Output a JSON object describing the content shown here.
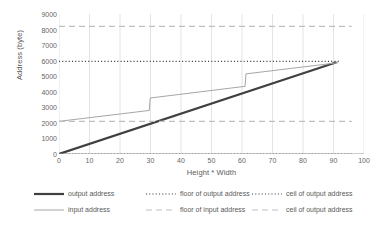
{
  "chart_data": {
    "type": "line",
    "title": "",
    "xlabel": "Height * Width",
    "ylabel": "Address (byte)",
    "xlim": [
      0,
      100
    ],
    "ylim": [
      0,
      9000
    ],
    "xticks": [
      "0",
      "10",
      "20",
      "30",
      "40",
      "50",
      "60",
      "70",
      "80",
      "90",
      "100"
    ],
    "yticks": [
      "0",
      "1000",
      "2000",
      "3000",
      "4000",
      "5000",
      "6000",
      "7000",
      "8000",
      "9000"
    ],
    "grid": "vertical-only",
    "legend_position": "bottom",
    "series": [
      {
        "name": "output address",
        "style": "solid",
        "color": "#404040",
        "width": 2.2,
        "x": [
          0,
          91
        ],
        "values": [
          0,
          5900
        ]
      },
      {
        "name": "floor of output address",
        "style": "dotted",
        "color": "#3f3f3f",
        "width": 1.2,
        "x": [
          0,
          96
        ],
        "values": [
          0,
          0
        ]
      },
      {
        "name": "ceil of output address",
        "style": "dotted",
        "color": "#3f3f3f",
        "width": 1.2,
        "x": [
          0,
          92
        ],
        "values": [
          5950,
          5950
        ]
      },
      {
        "name": "input address",
        "style": "solid",
        "color": "#a6a6a6",
        "width": 1,
        "x": [
          0,
          29.6,
          29.9,
          61.0,
          61.3,
          91.5
        ],
        "values": [
          2100,
          2800,
          3600,
          4350,
          5150,
          5870
        ]
      },
      {
        "name": "floor of input address",
        "style": "dashed",
        "color": "#bfbfbf",
        "width": 1.2,
        "x": [
          0,
          96
        ],
        "values": [
          2100,
          2100
        ]
      },
      {
        "name": "ceil of output address",
        "style": "dashed",
        "color": "#bfbfbf",
        "width": 1.2,
        "x": [
          0,
          96
        ],
        "values": [
          8200,
          8200
        ]
      }
    ]
  },
  "axes": {
    "y_title": "Address (byte)",
    "x_title": "Height * Width",
    "y_labels": [
      "9000",
      "8000",
      "7000",
      "6000",
      "5000",
      "4000",
      "3000",
      "2000",
      "1000",
      "0"
    ],
    "x_labels": [
      "0",
      "10",
      "20",
      "30",
      "40",
      "50",
      "60",
      "70",
      "80",
      "90",
      "100"
    ]
  },
  "legend": {
    "rows": [
      [
        {
          "label": "output address",
          "key": "solid-thick-dark"
        },
        {
          "label": "floor of output address",
          "key": "dotted-dark"
        },
        {
          "label": "ceil of output address",
          "key": "dotted-dark"
        }
      ],
      [
        {
          "label": "input address",
          "key": "solid-thin-gray"
        },
        {
          "label": "floor of input address",
          "key": "dashed-light"
        },
        {
          "label": "ceil of output address",
          "key": "dashed-light"
        }
      ]
    ]
  },
  "colors": {
    "output_address": "#404040",
    "input_address": "#a6a6a6",
    "floor_ceil_output": "#3f3f3f",
    "floor_ceil_input": "#bfbfbf",
    "gridline": "#e4e4e4",
    "axis": "#9a9a9a",
    "text": "#5a5a5a"
  }
}
